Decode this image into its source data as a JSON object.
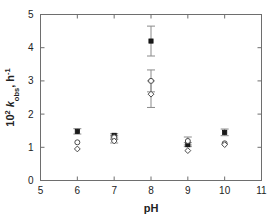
{
  "chart_data": {
    "type": "scatter",
    "title": "",
    "subtitle": "",
    "xlabel": "pH",
    "ylabel": "10² k_obs, h⁻¹",
    "ylabel_parts": {
      "prefix": "10",
      "prefix_sup": "2",
      "symbol": "k",
      "symbol_sub": "obs",
      "comma": ", ",
      "unit": "h",
      "unit_sup": "-1"
    },
    "xlim": [
      5,
      11
    ],
    "ylim": [
      0,
      5
    ],
    "xticks": [
      5,
      6,
      7,
      8,
      9,
      10,
      11
    ],
    "yticks": [
      0,
      1,
      2,
      3,
      4,
      5
    ],
    "xtick_labels": [
      "5",
      "6",
      "7",
      "8",
      "9",
      "10",
      "11"
    ],
    "ytick_labels": [
      "0",
      "1",
      "2",
      "3",
      "4",
      "5"
    ],
    "grid": false,
    "legend": "none",
    "frame": "box",
    "x": [
      6,
      7,
      8,
      9,
      10
    ],
    "series": [
      {
        "name": "filled-square",
        "marker": "square",
        "fill": "#1a1a1a",
        "values": [
          1.48,
          1.36,
          4.2,
          1.08,
          1.45
        ],
        "errors": [
          0.08,
          0.05,
          0.45,
          0.06,
          0.1
        ]
      },
      {
        "name": "open-circle",
        "marker": "circle",
        "fill": "none",
        "values": [
          1.15,
          1.3,
          3.0,
          1.19,
          1.12
        ],
        "errors": [
          0.0,
          0.06,
          0.33,
          0.12,
          0.0
        ]
      },
      {
        "name": "open-diamond",
        "marker": "diamond",
        "fill": "none",
        "values": [
          0.95,
          1.19,
          2.6,
          0.9,
          1.08
        ],
        "errors": [
          0.0,
          0.06,
          0.4,
          0.0,
          0.0
        ]
      }
    ]
  },
  "colors": {
    "axis": "#6e6e6e",
    "marker_fill": "#111111",
    "marker_stroke": "#4a4a4a",
    "error_bar": "#8a8a8a",
    "text": "#222222",
    "background": "#ffffff"
  },
  "axes": {
    "x_axis_name": "pH",
    "y_axis_name": "10^2 k_obs, h^-1"
  }
}
